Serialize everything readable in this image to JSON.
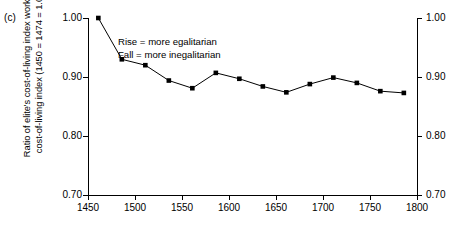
{
  "panel": {
    "label": "(c)"
  },
  "axes": {
    "y_title_line1": "Ratio of elite's cost-of-living index worker's",
    "y_title_line2": "cost-of-living index (1450 = 1474 = 1.00)",
    "y_ticks_left": [
      "1.00",
      "0.90",
      "0.80",
      "0.70"
    ],
    "y_ticks_right": [
      "1.00",
      "0.90",
      "0.80",
      "0.70"
    ],
    "x_ticks": [
      "1450",
      "1500",
      "1550",
      "1600",
      "1650",
      "1700",
      "1750",
      "1800"
    ]
  },
  "annotation": {
    "line1": "Rise = more egalitarian",
    "line2": "Fall = more inegalitarian"
  },
  "style": {
    "line_color": "#000000",
    "marker_color": "#000000",
    "axis_color": "#000000",
    "background": "#ffffff"
  },
  "chart_data": {
    "type": "line",
    "title": "",
    "subtitle": "",
    "xlabel": "",
    "ylabel": "Ratio of elite's cost-of-living index worker's cost-of-living index (1450 = 1474 = 1.00)",
    "xlim": [
      1450,
      1800
    ],
    "ylim": [
      0.7,
      1.0
    ],
    "xtick_values": [
      1450,
      1500,
      1550,
      1600,
      1650,
      1700,
      1750,
      1800
    ],
    "ytick_values": [
      0.7,
      0.8,
      0.9,
      1.0
    ],
    "grid": false,
    "legend": false,
    "legend_position": "none",
    "marker": "square",
    "annotations": [
      "Rise = more egalitarian",
      "Fall = more inegalitarian"
    ],
    "x": [
      1461,
      1486,
      1511,
      1536,
      1561,
      1586,
      1611,
      1636,
      1661,
      1686,
      1711,
      1736,
      1761,
      1786
    ],
    "values": [
      1.0,
      0.93,
      0.92,
      0.894,
      0.881,
      0.907,
      0.897,
      0.884,
      0.874,
      0.888,
      0.899,
      0.89,
      0.876,
      0.873
    ],
    "series": [
      {
        "name": "Elite/worker cost-of-living ratio",
        "values": [
          1.0,
          0.93,
          0.92,
          0.894,
          0.881,
          0.907,
          0.897,
          0.884,
          0.874,
          0.888,
          0.899,
          0.89,
          0.876,
          0.873
        ]
      }
    ]
  }
}
